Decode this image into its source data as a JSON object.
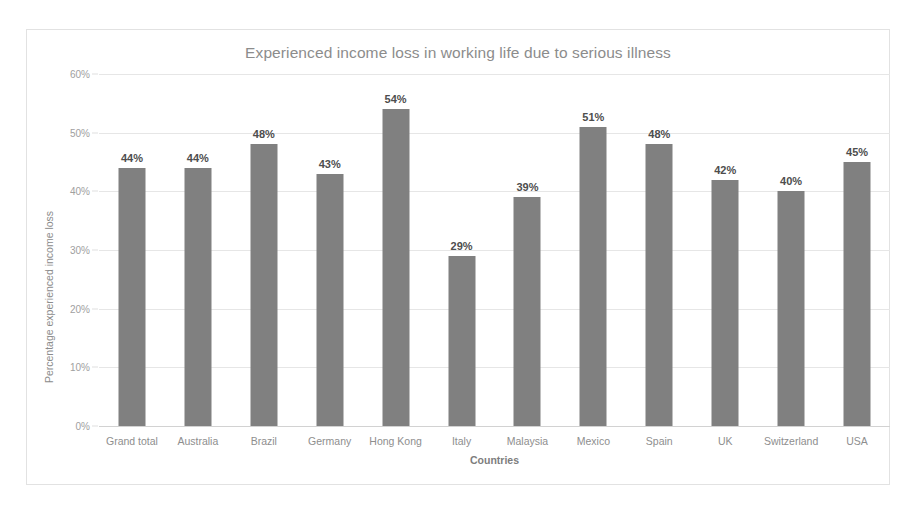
{
  "chart_data": {
    "type": "bar",
    "title": "Experienced income loss in working life due to serious illness",
    "xlabel": "Countries",
    "ylabel": "Percentage experienced income loss",
    "categories": [
      "Grand total",
      "Australia",
      "Brazil",
      "Germany",
      "Hong Kong",
      "Italy",
      "Malaysia",
      "Mexico",
      "Spain",
      "UK",
      "Switzerland",
      "USA"
    ],
    "values": [
      44,
      44,
      48,
      43,
      54,
      29,
      39,
      51,
      48,
      42,
      40,
      45
    ],
    "data_labels": [
      "44%",
      "44%",
      "48%",
      "43%",
      "54%",
      "29%",
      "39%",
      "51%",
      "48%",
      "42%",
      "40%",
      "45%"
    ],
    "ylim": [
      0,
      60
    ],
    "ytick_values": [
      0,
      10,
      20,
      30,
      40,
      50,
      60
    ],
    "ytick_labels": [
      "0%",
      "10%",
      "20%",
      "30%",
      "40%",
      "50%",
      "60%"
    ],
    "grid": true,
    "legend": "none",
    "bar_color": "#808080",
    "gridline_color": "#e6e6e6",
    "title_color": "#8c8c8c",
    "label_color": "#8e8e8e",
    "value_label_color": "#4d4d4d",
    "frame_color": "#e2e2e2",
    "background_color": "#ffffff"
  }
}
